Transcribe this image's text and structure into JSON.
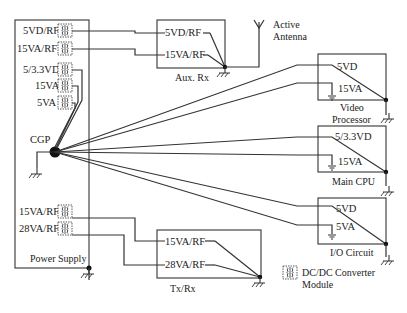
{
  "power_supply": {
    "label": "Power Supply",
    "outputs": [
      "5VD/RF",
      "15VA/RF",
      "5/3.3VD",
      "15VA",
      "5VA",
      "15VA/RF",
      "28VA/RF"
    ],
    "ground_point": "CGP"
  },
  "aux_rx": {
    "label": "Aux. Rx",
    "inputs": [
      "5VD/RF",
      "15VA/RF"
    ]
  },
  "antenna": {
    "label_line1": "Active",
    "label_line2": "Antenna"
  },
  "video_processor": {
    "label_line1": "Video",
    "label_line2": "Processor",
    "inputs": [
      "5VD",
      "15VA"
    ]
  },
  "main_cpu": {
    "label": "Main CPU",
    "inputs": [
      "5/3.3VD",
      "15VA"
    ]
  },
  "io_circuit": {
    "label": "I/O Circuit",
    "inputs": [
      "5VD",
      "5VA"
    ]
  },
  "tx_rx": {
    "label": "Tx/Rx",
    "inputs": [
      "15VA/RF",
      "28VA/RF"
    ]
  },
  "legend": {
    "line1": "DC/DC Converter",
    "line2": "Module",
    "icon": "transformer-icon"
  },
  "colors": {
    "line": "#333333",
    "background": "#ffffff"
  }
}
